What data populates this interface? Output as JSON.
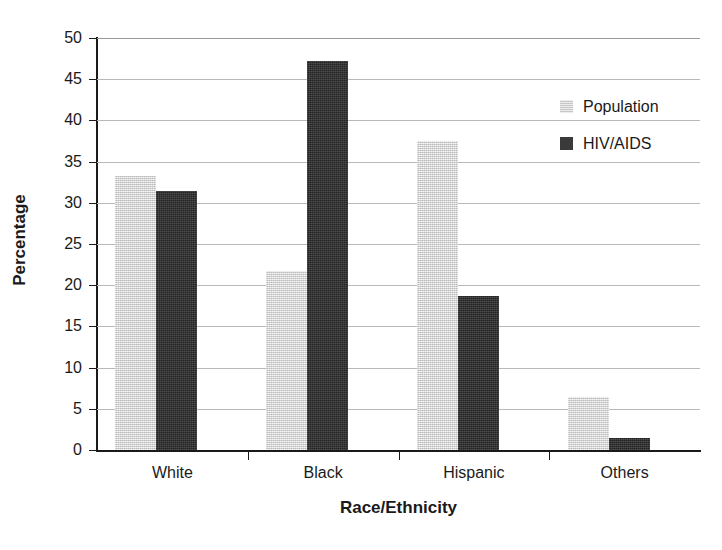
{
  "chart_data": {
    "type": "bar",
    "title": "",
    "xlabel": "Race/Ethnicity",
    "ylabel": "Percentage",
    "categories": [
      "White",
      "Black",
      "Hispanic",
      "Others"
    ],
    "series": [
      {
        "name": "Population",
        "values": [
          33.3,
          21.7,
          37.5,
          6.4
        ],
        "color": "#d6d6d6"
      },
      {
        "name": "HIV/AIDS",
        "values": [
          31.4,
          47.2,
          18.7,
          1.5
        ],
        "color": "#3a3a3a"
      }
    ],
    "ylim": [
      0,
      50
    ],
    "ytick_step": 5,
    "ytick_labels": [
      "50",
      "45",
      "40",
      "35",
      "30",
      "25",
      "20",
      "15",
      "10",
      "5",
      "0"
    ],
    "ytick_values": [
      50,
      45,
      40,
      35,
      30,
      25,
      20,
      15,
      10,
      5,
      0
    ],
    "grid": "horizontal",
    "legend_position": "top-right",
    "legend": [
      "Population",
      "HIV/AIDS"
    ]
  }
}
